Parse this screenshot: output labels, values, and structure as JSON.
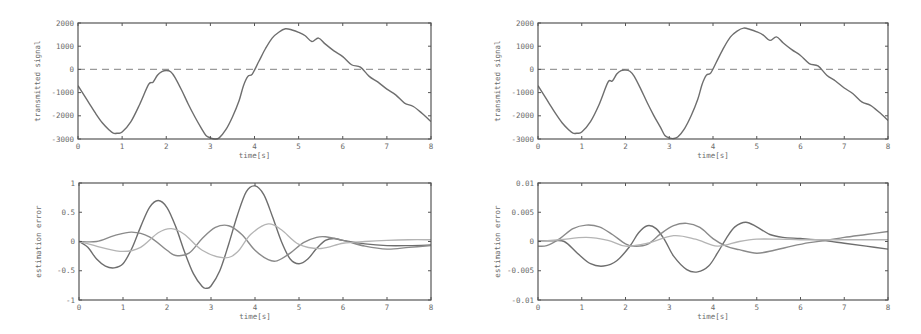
{
  "figure": {
    "width": 921,
    "height": 334,
    "colors": {
      "axis": "#555555",
      "tick_label": "#6a6a6a",
      "series_dark": "#6e6e6e",
      "series_mid": "#8a8a8a",
      "series_light": "#b4b4b4",
      "dashed_zero": "#9a9a9a"
    }
  },
  "chart_data": [
    {
      "id": "top-left",
      "type": "line",
      "title": "",
      "xlabel": "time[s]",
      "ylabel": "transmitted signal",
      "xlim": [
        0,
        8
      ],
      "ylim": [
        -3000,
        2000
      ],
      "xticks": [
        0,
        1,
        2,
        3,
        4,
        5,
        6,
        7,
        8
      ],
      "yticks": [
        -3000,
        -2000,
        -1000,
        0,
        1000,
        2000
      ],
      "ytick_labels": [
        "-3000",
        "-2000",
        "-1000",
        "0",
        "1000",
        "2000"
      ],
      "grid": false,
      "legend": null,
      "frame": {
        "x0": 78,
        "y0": 23,
        "x1": 431,
        "y1": 139
      },
      "reference_line": {
        "y": 0,
        "style": "dashed"
      },
      "series": [
        {
          "name": "transmitted signal",
          "style": "dark",
          "x": [
            0,
            0.1,
            0.25,
            0.4,
            0.55,
            0.7,
            0.8,
            0.9,
            1.0,
            1.2,
            1.4,
            1.6,
            1.7,
            1.8,
            1.9,
            2.0,
            2.1,
            2.2,
            2.35,
            2.5,
            2.65,
            2.8,
            2.9,
            3.0,
            3.1,
            3.2,
            3.35,
            3.5,
            3.65,
            3.75,
            3.85,
            3.95,
            4.1,
            4.25,
            4.4,
            4.55,
            4.7,
            4.85,
            5.0,
            5.15,
            5.3,
            5.45,
            5.6,
            5.8,
            6.0,
            6.2,
            6.4,
            6.6,
            6.8,
            7.0,
            7.2,
            7.4,
            7.6,
            7.8,
            8.0
          ],
          "values": [
            -700,
            -1000,
            -1450,
            -1900,
            -2300,
            -2600,
            -2750,
            -2750,
            -2700,
            -2250,
            -1500,
            -650,
            -550,
            -250,
            -100,
            -50,
            -100,
            -350,
            -900,
            -1500,
            -2050,
            -2550,
            -2850,
            -2950,
            -3000,
            -2950,
            -2600,
            -2050,
            -1350,
            -700,
            -300,
            -200,
            350,
            900,
            1350,
            1600,
            1750,
            1700,
            1600,
            1450,
            1200,
            1350,
            1100,
            800,
            550,
            200,
            100,
            -300,
            -550,
            -850,
            -1100,
            -1450,
            -1600,
            -1900,
            -2250
          ]
        }
      ]
    },
    {
      "id": "top-right",
      "type": "line",
      "title": "",
      "xlabel": "time[s]",
      "ylabel": "transmitted signal",
      "xlim": [
        0,
        8
      ],
      "ylim": [
        -3000,
        2000
      ],
      "xticks": [
        0,
        1,
        2,
        3,
        4,
        5,
        6,
        7,
        8
      ],
      "yticks": [
        -3000,
        -2000,
        -1000,
        0,
        1000,
        2000
      ],
      "ytick_labels": [
        "-3000",
        "-2000",
        "-1000",
        "0",
        "1000",
        "2000"
      ],
      "grid": false,
      "legend": null,
      "frame": {
        "x0": 538,
        "y0": 23,
        "x1": 888,
        "y1": 139
      },
      "reference_line": {
        "y": 0,
        "style": "dashed"
      },
      "series": [
        {
          "name": "transmitted signal",
          "style": "dark",
          "x": [
            0,
            0.1,
            0.25,
            0.4,
            0.55,
            0.7,
            0.8,
            0.9,
            1.0,
            1.2,
            1.4,
            1.6,
            1.7,
            1.8,
            1.9,
            2.0,
            2.1,
            2.2,
            2.35,
            2.5,
            2.65,
            2.8,
            2.9,
            3.0,
            3.1,
            3.2,
            3.35,
            3.5,
            3.65,
            3.75,
            3.85,
            3.95,
            4.1,
            4.25,
            4.4,
            4.55,
            4.7,
            4.85,
            5.0,
            5.15,
            5.3,
            5.45,
            5.6,
            5.8,
            6.0,
            6.2,
            6.4,
            6.6,
            6.8,
            7.0,
            7.2,
            7.4,
            7.6,
            7.8,
            8.0
          ],
          "values": [
            -700,
            -1000,
            -1450,
            -1900,
            -2300,
            -2600,
            -2750,
            -2750,
            -2700,
            -2250,
            -1500,
            -550,
            -500,
            -200,
            -50,
            -30,
            -80,
            -300,
            -850,
            -1450,
            -2000,
            -2500,
            -2850,
            -2950,
            -2980,
            -2900,
            -2550,
            -2000,
            -1300,
            -650,
            -250,
            -150,
            400,
            950,
            1400,
            1650,
            1780,
            1720,
            1620,
            1480,
            1250,
            1400,
            1150,
            850,
            600,
            250,
            150,
            -250,
            -500,
            -800,
            -1050,
            -1400,
            -1550,
            -1850,
            -2200
          ]
        }
      ]
    },
    {
      "id": "bottom-left",
      "type": "line",
      "title": "",
      "xlabel": "time[s]",
      "ylabel": "estimation error",
      "xlim": [
        0,
        8
      ],
      "ylim": [
        -1,
        1
      ],
      "xticks": [
        0,
        1,
        2,
        3,
        4,
        5,
        6,
        7,
        8
      ],
      "yticks": [
        -1,
        -0.5,
        0,
        0.5,
        1
      ],
      "ytick_labels": [
        "-1",
        "-0.5",
        "0",
        "0.5",
        "1"
      ],
      "grid": false,
      "legend": null,
      "frame": {
        "x0": 79,
        "y0": 183,
        "x1": 431,
        "y1": 300
      },
      "reference_line": null,
      "series": [
        {
          "name": "error 1",
          "style": "dark",
          "x": [
            0,
            0.2,
            0.4,
            0.6,
            0.8,
            1.0,
            1.2,
            1.4,
            1.6,
            1.8,
            2.0,
            2.2,
            2.4,
            2.6,
            2.8,
            2.9,
            3.0,
            3.2,
            3.4,
            3.6,
            3.8,
            4.0,
            4.2,
            4.4,
            4.6,
            4.8,
            5.0,
            5.2,
            5.4,
            5.6,
            5.8,
            6.0,
            6.5,
            7.0,
            7.5,
            8.0
          ],
          "values": [
            0,
            -0.1,
            -0.3,
            -0.42,
            -0.45,
            -0.38,
            -0.12,
            0.25,
            0.58,
            0.7,
            0.58,
            0.25,
            -0.18,
            -0.55,
            -0.77,
            -0.8,
            -0.76,
            -0.5,
            -0.05,
            0.45,
            0.85,
            0.95,
            0.8,
            0.42,
            0.0,
            -0.3,
            -0.38,
            -0.3,
            -0.12,
            0.02,
            0.05,
            0.02,
            -0.04,
            -0.07,
            -0.07,
            -0.06
          ]
        },
        {
          "name": "error 2",
          "style": "mid",
          "x": [
            0,
            0.4,
            0.8,
            1.2,
            1.6,
            2.0,
            2.2,
            2.5,
            2.8,
            3.1,
            3.4,
            3.7,
            4.0,
            4.3,
            4.5,
            4.8,
            5.1,
            5.4,
            5.6,
            6.0,
            6.5,
            7.0,
            7.5,
            8.0
          ],
          "values": [
            0,
            0.0,
            0.1,
            0.16,
            0.08,
            -0.15,
            -0.24,
            -0.2,
            0.05,
            0.24,
            0.27,
            0.12,
            -0.15,
            -0.31,
            -0.33,
            -0.2,
            -0.02,
            0.07,
            0.08,
            0.02,
            -0.08,
            -0.13,
            -0.1,
            -0.07
          ]
        },
        {
          "name": "error 3",
          "style": "light",
          "x": [
            0,
            0.5,
            1.0,
            1.4,
            1.8,
            2.1,
            2.4,
            2.8,
            3.3,
            3.6,
            3.9,
            4.3,
            4.6,
            5.0,
            5.5,
            6.0,
            6.5,
            7.0,
            7.5,
            8.0
          ],
          "values": [
            0,
            -0.1,
            -0.17,
            -0.1,
            0.15,
            0.22,
            0.12,
            -0.15,
            -0.28,
            -0.18,
            0.12,
            0.3,
            0.2,
            -0.05,
            -0.12,
            -0.03,
            0.0,
            0.02,
            0.03,
            0.03
          ]
        }
      ]
    },
    {
      "id": "bottom-right",
      "type": "line",
      "title": "",
      "xlabel": "time[s]",
      "ylabel": "estimation error",
      "xlim": [
        0,
        8
      ],
      "ylim": [
        -0.01,
        0.01
      ],
      "xticks": [
        0,
        1,
        2,
        3,
        4,
        5,
        6,
        7,
        8
      ],
      "yticks": [
        -0.01,
        -0.005,
        0,
        0.005,
        0.01
      ],
      "ytick_labels": [
        "-0.01",
        "-0.005",
        "0",
        "0.005",
        "0.01"
      ],
      "grid": false,
      "legend": null,
      "frame": {
        "x0": 538,
        "y0": 183,
        "x1": 888,
        "y1": 300
      },
      "reference_line": null,
      "series": [
        {
          "name": "error 1",
          "style": "dark",
          "x": [
            0,
            0.3,
            0.6,
            0.9,
            1.2,
            1.5,
            1.8,
            2.1,
            2.3,
            2.5,
            2.7,
            2.9,
            3.1,
            3.4,
            3.65,
            3.9,
            4.1,
            4.3,
            4.5,
            4.75,
            5.0,
            5.3,
            5.6,
            6.0,
            6.5,
            7.0,
            7.5,
            8.0
          ],
          "values": [
            0.0001,
            0.0001,
            0.0,
            -0.002,
            -0.0038,
            -0.0042,
            -0.0033,
            -0.0008,
            0.0015,
            0.0027,
            0.0022,
            0.0002,
            -0.0025,
            -0.0048,
            -0.0052,
            -0.0042,
            -0.002,
            0.0005,
            0.0025,
            0.0033,
            0.0025,
            0.0012,
            0.0007,
            0.0005,
            0.0002,
            -0.0003,
            -0.0008,
            -0.0013
          ]
        },
        {
          "name": "error 2",
          "style": "mid",
          "x": [
            0,
            0.2,
            0.5,
            0.8,
            1.1,
            1.4,
            1.7,
            2.0,
            2.2,
            2.5,
            2.8,
            3.1,
            3.4,
            3.7,
            4.0,
            4.3,
            4.6,
            5.0,
            5.4,
            5.8,
            6.2,
            6.6,
            7.0,
            7.5,
            8.0
          ],
          "values": [
            -0.0008,
            -0.0007,
            0.0005,
            0.0022,
            0.0028,
            0.0025,
            0.0012,
            -0.0004,
            -0.0008,
            -0.0005,
            0.0013,
            0.0027,
            0.0031,
            0.0024,
            0.0005,
            -0.0008,
            -0.0014,
            -0.002,
            -0.0015,
            -0.0008,
            -0.0002,
            0.0002,
            0.0007,
            0.0012,
            0.0017
          ]
        },
        {
          "name": "error 3",
          "style": "light",
          "x": [
            0,
            0.5,
            1.1,
            1.6,
            2.0,
            2.5,
            3.1,
            3.6,
            4.1,
            4.6,
            5.0,
            5.5,
            6.0,
            6.5,
            7.0,
            7.5,
            8.0
          ],
          "values": [
            0,
            0.0003,
            0.0007,
            0.0002,
            -0.0008,
            -0.0003,
            0.001,
            0.0004,
            -0.0008,
            0.0,
            0.0004,
            0.0004,
            0.0003,
            0.0003,
            0.0003,
            0.0003,
            0.0003
          ]
        }
      ]
    }
  ]
}
